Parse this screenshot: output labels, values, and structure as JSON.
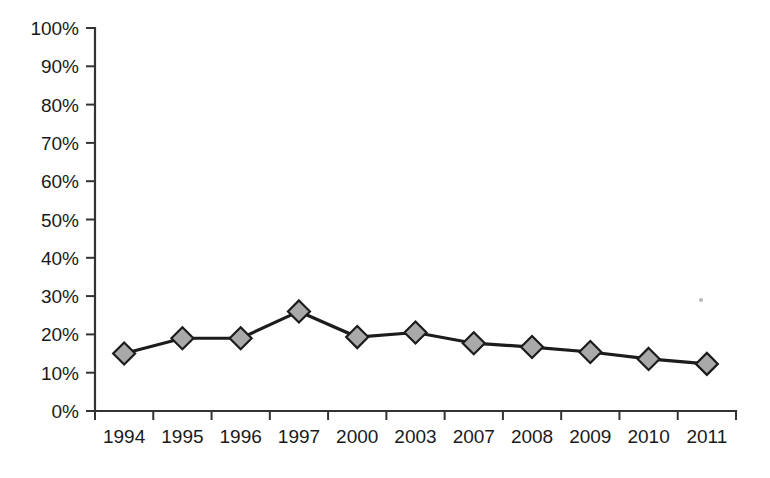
{
  "chart_data": {
    "type": "line",
    "title": "",
    "subtitle": "",
    "xlabel": "",
    "ylabel": "",
    "categories": [
      "1994",
      "1995",
      "1996",
      "1997",
      "2000",
      "2003",
      "2007",
      "2008",
      "2009",
      "2010",
      "2011"
    ],
    "values": [
      15,
      19,
      19,
      26,
      19.3,
      20.5,
      17.7,
      16.7,
      15.4,
      13.6,
      12.3
    ],
    "series": [
      {
        "name": "",
        "values": [
          15,
          19,
          19,
          26,
          19.3,
          20.5,
          17.7,
          16.7,
          15.4,
          13.6,
          12.3
        ]
      }
    ],
    "ylim": [
      0,
      100
    ],
    "y_ticks": [
      0,
      10,
      20,
      30,
      40,
      50,
      60,
      70,
      80,
      90,
      100
    ],
    "y_tick_labels": [
      "0%",
      "10%",
      "20%",
      "30%",
      "40%",
      "50%",
      "60%",
      "70%",
      "80%",
      "90%",
      "100%"
    ],
    "x_tick_labels": [
      "1994",
      "1995",
      "1996",
      "1997",
      "2000",
      "2003",
      "2007",
      "2008",
      "2009",
      "2010",
      "2011"
    ],
    "grid": false,
    "legend": false,
    "legend_position": "none",
    "marker": "diamond",
    "marker_color": "#a9a9a9",
    "line_color": "#1c1c1c",
    "background_color": "#ffffff",
    "annotations": []
  }
}
